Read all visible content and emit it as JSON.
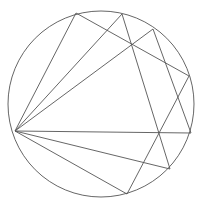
{
  "diagram": {
    "stroke_color": "#555555",
    "background_color": "#ffffff",
    "points": {
      "A": "left point on circle (fan origin)",
      "B": "top-left point on circle",
      "C": "top point on circle",
      "D": "upper-right point on circle",
      "E": "right point on circle",
      "F": "right-lower point on circle",
      "G": "lower-right point on circle",
      "H": "bottom point on circle"
    },
    "chords": [
      [
        "A",
        "B"
      ],
      [
        "A",
        "C"
      ],
      [
        "A",
        "D"
      ],
      [
        "A",
        "F"
      ],
      [
        "A",
        "G"
      ],
      [
        "A",
        "H"
      ],
      [
        "B",
        "E"
      ],
      [
        "C",
        "G"
      ],
      [
        "D",
        "F"
      ],
      [
        "E",
        "H"
      ]
    ],
    "labels_visible": false
  }
}
